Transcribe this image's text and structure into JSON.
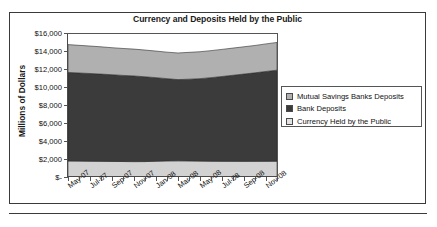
{
  "figure": {
    "title": "Currency and Deposits Held by the Public"
  },
  "chart_data": {
    "type": "area",
    "stacked": true,
    "title": "Currency and Deposits Held by the Public",
    "xlabel": "",
    "ylabel": "Millions of Dollars",
    "ylim": [
      0,
      16000
    ],
    "ytick_labels": [
      "$16,000",
      "$14,000",
      "$12,000",
      "$10,000",
      "$8,000",
      "$6,000",
      "$4,000",
      "$2,000",
      "$-"
    ],
    "ytick_values": [
      16000,
      14000,
      12000,
      10000,
      8000,
      6000,
      4000,
      2000,
      0
    ],
    "xtick_labels": [
      "May-07",
      "Jul-07",
      "Sep-07",
      "Nov-07",
      "Jan-08",
      "Mar-08",
      "May-08",
      "Jul-08",
      "Sep-08",
      "Nov-08"
    ],
    "x": [
      "May-07",
      "Jun-07",
      "Jul-07",
      "Aug-07",
      "Sep-07",
      "Oct-07",
      "Nov-07",
      "Dec-07",
      "Jan-08",
      "Feb-08",
      "Mar-08",
      "Apr-08",
      "May-08",
      "Jun-08",
      "Jul-08",
      "Aug-08",
      "Sep-08",
      "Oct-08",
      "Nov-08",
      "Dec-08"
    ],
    "grid": false,
    "legend_position": "right",
    "series": [
      {
        "name": "Currency Held by the Public",
        "color": "#d2d2d2",
        "values": [
          1780,
          1770,
          1760,
          1745,
          1735,
          1720,
          1710,
          1715,
          1760,
          1790,
          1800,
          1790,
          1770,
          1760,
          1750,
          1745,
          1740,
          1745,
          1750,
          1760
        ]
      },
      {
        "name": "Bank Deposits",
        "color": "#3b3b3b",
        "values": [
          9840,
          9790,
          9740,
          9690,
          9630,
          9570,
          9520,
          9420,
          9280,
          9140,
          9020,
          9080,
          9160,
          9280,
          9420,
          9560,
          9700,
          9830,
          9980,
          10110
        ]
      },
      {
        "name": "Mutual Savings Banks Deposits",
        "color": "#b0b0b0",
        "values": [
          3090,
          3070,
          3050,
          3030,
          3000,
          2990,
          2980,
          2970,
          2950,
          2940,
          2960,
          2980,
          2990,
          3000,
          3010,
          3020,
          3030,
          3040,
          3060,
          3080
        ]
      }
    ]
  },
  "legend": {
    "items": [
      {
        "label": "Mutual Savings Banks Deposits",
        "color": "#b0b0b0"
      },
      {
        "label": "Bank Deposits",
        "color": "#3b3b3b"
      },
      {
        "label": "Currency Held by the Public",
        "color": "#e2e2e2"
      }
    ]
  }
}
